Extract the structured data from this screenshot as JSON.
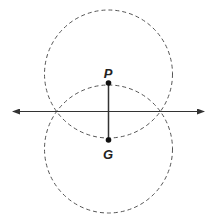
{
  "diagram": {
    "type": "perpendicular-bisector-construction",
    "points": [
      {
        "label": "P",
        "x": 108.5,
        "y": 83
      },
      {
        "label": "G",
        "x": 108.5,
        "y": 140
      }
    ],
    "labels": {
      "P": "P",
      "G": "G"
    },
    "circles": [
      {
        "name": "upper-circle",
        "cx": 108.5,
        "cy": 74,
        "r": 64,
        "style": "dashed"
      },
      {
        "name": "lower-circle",
        "cx": 108.5,
        "cy": 149,
        "r": 64,
        "style": "dashed"
      }
    ],
    "line": {
      "name": "horizontal-line",
      "x1": 12,
      "x2": 205,
      "y": 111.5,
      "arrows": "both"
    },
    "segment": {
      "name": "segment-PG",
      "from": "P",
      "to": "G"
    },
    "colors": {
      "stroke": "#333333",
      "dashed": "#555555",
      "background": "#ffffff"
    }
  }
}
